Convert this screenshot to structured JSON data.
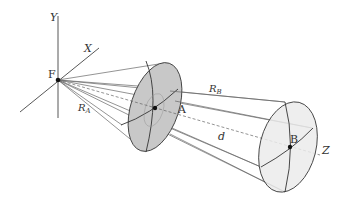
{
  "diagram": {
    "type": "geometry-3d-projection",
    "colors": {
      "line": "#555555",
      "axis": "#444444",
      "ellipse_a_fill": "#c8c8c8",
      "ellipse_b_fill": "#ebebeb",
      "point": "#111111"
    },
    "labels": {
      "y_axis": "Y",
      "x_axis": "X",
      "z_axis": "Z",
      "origin": "F",
      "point_a": "A",
      "point_b": "B",
      "radius_a": "R",
      "radius_a_sub": "A",
      "radius_b": "R",
      "radius_b_sub": "B",
      "distance": "d"
    }
  }
}
